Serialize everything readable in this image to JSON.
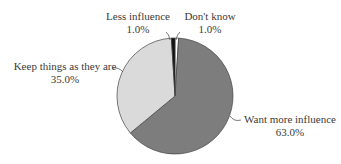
{
  "chart_data": {
    "type": "pie",
    "title": "",
    "categories": [
      "Don't know",
      "Want more influence",
      "Keep things as they are",
      "Less influence"
    ],
    "values": [
      1.0,
      63.0,
      35.0,
      1.0
    ],
    "labels": [
      "1.0%",
      "63.0%",
      "35.0%",
      "1.0%"
    ],
    "colors": [
      "#ffffff",
      "#7d7d7d",
      "#dadada",
      "#111111"
    ],
    "start_angle_deg": 0,
    "direction": "clockwise",
    "legend": "none (leader-line labels)"
  },
  "labels": {
    "less_influence": {
      "name": "Less influence",
      "pct": "1.0%"
    },
    "dont_know": {
      "name": "Don't know",
      "pct": "1.0%"
    },
    "keep_things": {
      "name": "Keep things as they are",
      "pct": "35.0%"
    },
    "want_more": {
      "name": "Want more influence",
      "pct": "63.0%"
    }
  }
}
